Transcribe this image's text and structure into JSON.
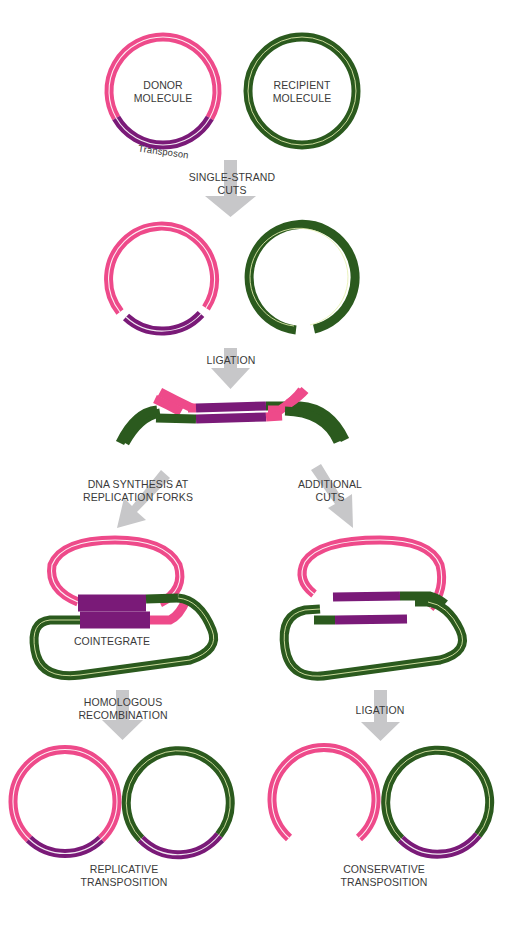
{
  "labels": {
    "donor_line1": "DONOR",
    "donor_line2": "MOLECULE",
    "recipient_line1": "RECIPIENT",
    "recipient_line2": "MOLECULE",
    "transposon": "Transposon",
    "step1_line1": "SINGLE-STRAND",
    "step1_line2": "CUTS",
    "step2": "LIGATION",
    "left_step_line1": "DNA SYNTHESIS AT",
    "left_step_line2": "REPLICATION FORKS",
    "right_step_line1": "ADDITIONAL",
    "right_step_line2": "CUTS",
    "cointegrate": "COINTEGRATE",
    "left_final_step_line1": "HOMOLOGOUS",
    "left_final_step_line2": "RECOMBINATION",
    "right_final_step": "LIGATION",
    "left_outcome_line1": "REPLICATIVE",
    "left_outcome_line2": "TRANSPOSITION",
    "right_outcome_line1": "CONSERVATIVE",
    "right_outcome_line2": "TRANSPOSITION"
  },
  "colors": {
    "donor_dna": "#ee4a8a",
    "recipient_dna": "#2b5a1e",
    "transposon": "#7a1a78",
    "arrow": "#c7c7c9",
    "text": "#3a3a3a"
  }
}
